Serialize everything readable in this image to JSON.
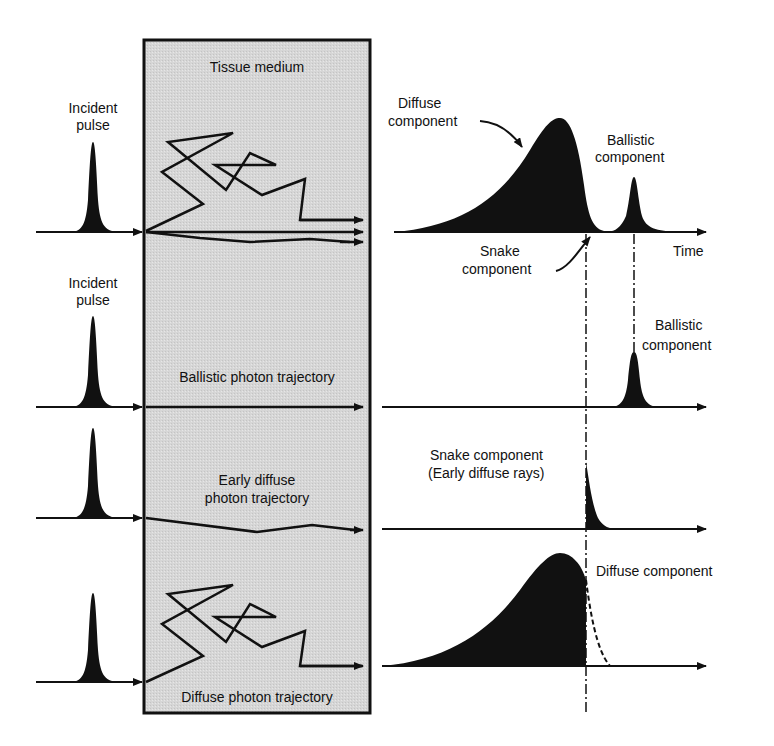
{
  "colors": {
    "ink": "#111111",
    "box_fill": "#d9d9d9",
    "background": "#ffffff"
  },
  "medium": {
    "label": "Tissue medium"
  },
  "rows": [
    {
      "id": "combined",
      "incident_label_line1": "Incident",
      "incident_label_line2": "pulse",
      "trajectory_label": "",
      "output_labels": {
        "diffuse_line1": "Diffuse",
        "diffuse_line2": "component",
        "ballistic_line1": "Ballistic",
        "ballistic_line2": "component",
        "snake_line1": "Snake",
        "snake_line2": "component",
        "axis": "Time"
      }
    },
    {
      "id": "ballistic",
      "incident_label_line1": "Incident",
      "incident_label_line2": "pulse",
      "trajectory_label": "Ballistic photon trajectory",
      "output_label_line1": "Ballistic",
      "output_label_line2": "component"
    },
    {
      "id": "snake",
      "trajectory_label_line1": "Early diffuse",
      "trajectory_label_line2": "photon trajectory",
      "output_label_line1": "Snake component",
      "output_label_line2": "(Early diffuse rays)"
    },
    {
      "id": "diffuse",
      "trajectory_label": "Diffuse photon trajectory",
      "output_label": "Diffuse component"
    }
  ]
}
